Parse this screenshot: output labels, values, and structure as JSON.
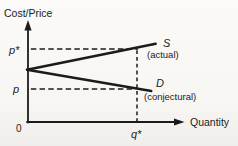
{
  "figure": {
    "ylabel": "Cost/Price",
    "xlabel": "Quantity",
    "origin": "0",
    "labels": {
      "p_star": "p*",
      "p": "p",
      "q_star": "q*",
      "s": "S",
      "s_note": "(actual)",
      "d": "D",
      "d_note": "(conjectural)"
    },
    "colors": {
      "ink": "#1b1b1b",
      "paper": "#f7f6f3"
    }
  },
  "chart_data": {
    "type": "line",
    "title": "",
    "xlabel": "Quantity",
    "ylabel": "Cost/Price",
    "grid": false,
    "axes_style": "arrowed, hand-drawn, no numeric scale",
    "x_ticks": [
      {
        "label": "q*",
        "value": 1
      }
    ],
    "y_ticks": [
      {
        "label": "p",
        "value": 1
      },
      {
        "label": "p*",
        "value": 2
      }
    ],
    "origin_label": "0",
    "x_range_shown": [
      0,
      1.4
    ],
    "y_range_shown": [
      0,
      2.4
    ],
    "series": [
      {
        "name": "S",
        "annotation": "(actual)",
        "style": "solid",
        "points_x": [
          0,
          1.17
        ],
        "points_y": [
          1.48,
          2.13
        ],
        "note": "rises from common intercept on price axis, passes through (q*, p*)"
      },
      {
        "name": "D",
        "annotation": "(conjectural)",
        "style": "solid",
        "points_x": [
          0,
          1.13
        ],
        "points_y": [
          1.48,
          0.95
        ],
        "note": "falls from common intercept on price axis, passes through (q*, p)"
      }
    ],
    "reference_lines": [
      {
        "axis": "y",
        "at": 2,
        "from_x": 0.035,
        "to_x": 1.01,
        "label": "p*",
        "style": "dashed"
      },
      {
        "axis": "y",
        "at": 1,
        "from_x": 0.035,
        "to_x": 0.985,
        "label": "p",
        "style": "dashed"
      },
      {
        "axis": "x",
        "at": 1,
        "from_y": 0.175,
        "to_y": 2.02,
        "label": "q*",
        "style": "dashed"
      }
    ],
    "legend_position": "inline right of curves"
  }
}
